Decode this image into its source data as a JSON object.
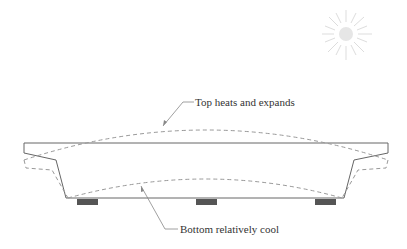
{
  "diagram": {
    "labels": {
      "top": "Top heats and expands",
      "bottom": "Bottom relatively cool"
    },
    "elements": {
      "sun": "sun-icon",
      "girder_outline": "original girder cross-section (solid)",
      "deformed_outline": "deformed shape (dashed)",
      "bearings": 3
    },
    "colors": {
      "outline": "#555555",
      "dashed": "#888888",
      "bearing": "#555555",
      "sun": "#dddddd",
      "text": "#333333"
    }
  }
}
